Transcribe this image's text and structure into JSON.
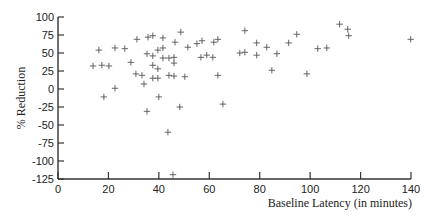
{
  "chart_data": {
    "type": "scatter",
    "title": "",
    "xlabel": "Baseline Latency (in minutes)",
    "ylabel": "% Reduction",
    "xlim": [
      0,
      140
    ],
    "ylim": [
      -125,
      100
    ],
    "xticks": [
      0,
      20,
      40,
      60,
      80,
      100,
      120,
      140
    ],
    "yticks": [
      100,
      75,
      50,
      25,
      0,
      -25,
      -50,
      -75,
      -100,
      -125
    ],
    "grid": false,
    "legend": null,
    "marker": "plus",
    "marker_color": "#555555",
    "series": [
      {
        "name": "subjects",
        "points": [
          [
            13.9,
            32
          ],
          [
            16.2,
            54
          ],
          [
            17.4,
            33
          ],
          [
            20.2,
            32
          ],
          [
            18.2,
            -11
          ],
          [
            22.6,
            57
          ],
          [
            22.6,
            1
          ],
          [
            26.5,
            56
          ],
          [
            28.9,
            37
          ],
          [
            30.9,
            21
          ],
          [
            33.3,
            19
          ],
          [
            34.1,
            7
          ],
          [
            31.3,
            69
          ],
          [
            35.3,
            -31
          ],
          [
            35.7,
            72
          ],
          [
            37.6,
            74
          ],
          [
            41.6,
            71
          ],
          [
            35.3,
            49
          ],
          [
            37.6,
            46
          ],
          [
            37.6,
            33
          ],
          [
            37.6,
            15
          ],
          [
            39.6,
            15
          ],
          [
            39.6,
            28
          ],
          [
            39.6,
            54
          ],
          [
            41.6,
            57
          ],
          [
            41.6,
            43
          ],
          [
            44.0,
            43
          ],
          [
            46.0,
            44
          ],
          [
            46.0,
            36
          ],
          [
            44.0,
            19
          ],
          [
            46.0,
            18
          ],
          [
            46.4,
            65
          ],
          [
            48.7,
            79
          ],
          [
            50.3,
            17
          ],
          [
            51.5,
            58
          ],
          [
            40.0,
            -11
          ],
          [
            43.6,
            -60
          ],
          [
            48.3,
            -25
          ],
          [
            45.6,
            -119
          ],
          [
            55.1,
            63
          ],
          [
            57.1,
            67
          ],
          [
            56.7,
            44
          ],
          [
            59.0,
            47
          ],
          [
            61.4,
            44
          ],
          [
            61.8,
            65
          ],
          [
            63.4,
            69
          ],
          [
            63.4,
            19
          ],
          [
            65.4,
            -21
          ],
          [
            72.1,
            50
          ],
          [
            74.1,
            51
          ],
          [
            74.1,
            81
          ],
          [
            78.8,
            64
          ],
          [
            78.8,
            47
          ],
          [
            82.8,
            58
          ],
          [
            84.8,
            26
          ],
          [
            86.8,
            49
          ],
          [
            91.5,
            64
          ],
          [
            94.7,
            76
          ],
          [
            98.7,
            21
          ],
          [
            103.0,
            56
          ],
          [
            106.6,
            57
          ],
          [
            111.7,
            90
          ],
          [
            114.9,
            83
          ],
          [
            115.3,
            74
          ],
          [
            139.9,
            69
          ]
        ]
      }
    ]
  }
}
